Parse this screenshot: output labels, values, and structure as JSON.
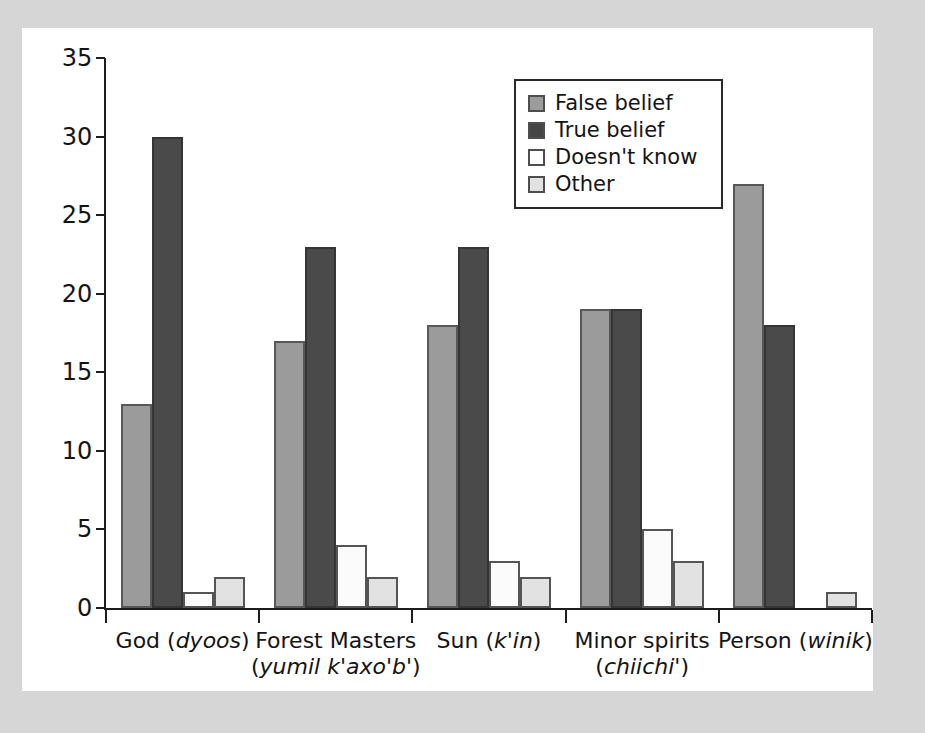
{
  "figure": {
    "background_color": "#d6d6d6",
    "panel_color": "#ffffff"
  },
  "chart_data": {
    "type": "bar",
    "title": "",
    "subtitle": "",
    "xlabel": "",
    "ylabel": "",
    "ylim": [
      0,
      35
    ],
    "ytick_step": 5,
    "yticks": [
      0,
      5,
      10,
      15,
      20,
      25,
      30,
      35
    ],
    "ytick_labels": [
      "0",
      "5",
      "10",
      "15",
      "20",
      "25",
      "30",
      "35"
    ],
    "grid": false,
    "legend_position": "top-right-inside",
    "categories": [
      "God (dyoos)",
      "Forest Masters (yumil k'axo'b')",
      "Sun (k'in)",
      "Minor spirits (chiichi')",
      "Person (winik)"
    ],
    "category_labels": [
      {
        "line1": "God (",
        "native": "dyoos",
        "line1_end": ")",
        "line2": "",
        "native2": "",
        "line2_end": ""
      },
      {
        "line1": "Forest Masters",
        "native": "",
        "line1_end": "",
        "line2": "(",
        "native2": "yumil k'axo'b'",
        "line2_end": ")"
      },
      {
        "line1": "Sun (",
        "native": "k'in",
        "line1_end": ")",
        "line2": "",
        "native2": "",
        "line2_end": ""
      },
      {
        "line1": "Minor spirits",
        "native": "",
        "line1_end": "",
        "line2": "(",
        "native2": "chiichi'",
        "line2_end": ")"
      },
      {
        "line1": "Person (",
        "native": "winik",
        "line1_end": ")",
        "line2": "",
        "native2": "",
        "line2_end": ""
      }
    ],
    "series": [
      {
        "name": "False belief",
        "key": "false",
        "color": "#9b9b9b",
        "values": [
          13,
          17,
          18,
          19,
          27
        ]
      },
      {
        "name": "True belief",
        "key": "true",
        "color": "#4a4a4a",
        "values": [
          30,
          23,
          23,
          19,
          18
        ]
      },
      {
        "name": "Doesn't know",
        "key": "dk",
        "color": "#fbfbfb",
        "values": [
          1,
          4,
          3,
          5,
          0
        ]
      },
      {
        "name": "Other",
        "key": "other",
        "color": "#e2e2e2",
        "values": [
          2,
          2,
          2,
          3,
          1
        ]
      }
    ]
  },
  "legend": {
    "items": [
      {
        "label": "False belief",
        "key": "false"
      },
      {
        "label": "True belief",
        "key": "true"
      },
      {
        "label": "Doesn't know",
        "key": "dk"
      },
      {
        "label": "Other",
        "key": "other"
      }
    ]
  }
}
